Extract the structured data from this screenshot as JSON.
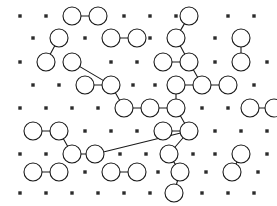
{
  "figure": {
    "width": 277,
    "height": 206,
    "background_color": "#ffffff",
    "stroke_color": "#1a1a1a",
    "square_fill_color": "#2b2b2b",
    "circle_fill_color": "#ffffff",
    "circle_radius": 9,
    "square_size": 3.4,
    "edge_width": 1.1,
    "circle_stroke_width": 1.1,
    "grid": {
      "columns": 10,
      "rows": 9,
      "x_spacing": 26,
      "y_spacing": 23,
      "x_origin": 20,
      "y_origin": 16,
      "row_offset": 13,
      "description": "alternating rows shifted by half a column"
    }
  },
  "chart_data": {
    "type": "scatter",
    "xlabel": "",
    "ylabel": "",
    "xlim": [
      0,
      277
    ],
    "ylim": [
      0,
      206
    ],
    "grid": false,
    "legend": null,
    "nodes": [
      {
        "id": "r0c0",
        "x": 20,
        "y": 16,
        "kind": "square"
      },
      {
        "id": "r0c1",
        "x": 46,
        "y": 16,
        "kind": "square"
      },
      {
        "id": "r0c2",
        "x": 72,
        "y": 16,
        "kind": "circle"
      },
      {
        "id": "r0c3",
        "x": 98,
        "y": 16,
        "kind": "circle"
      },
      {
        "id": "r0c4",
        "x": 124,
        "y": 16,
        "kind": "square"
      },
      {
        "id": "r0c5",
        "x": 150,
        "y": 16,
        "kind": "square"
      },
      {
        "id": "r0c6",
        "x": 176,
        "y": 16,
        "kind": "square"
      },
      {
        "id": "r0c7",
        "x": 189,
        "y": 16,
        "kind": "circle"
      },
      {
        "id": "r0c8",
        "x": 228,
        "y": 16,
        "kind": "square"
      },
      {
        "id": "r0c9",
        "x": 254,
        "y": 16,
        "kind": "square"
      },
      {
        "id": "r1c0",
        "x": 33,
        "y": 38,
        "kind": "square"
      },
      {
        "id": "r1c1",
        "x": 59,
        "y": 38,
        "kind": "circle"
      },
      {
        "id": "r1c2",
        "x": 85,
        "y": 38,
        "kind": "square"
      },
      {
        "id": "r1c3",
        "x": 111,
        "y": 38,
        "kind": "circle"
      },
      {
        "id": "r1c4",
        "x": 137,
        "y": 38,
        "kind": "circle"
      },
      {
        "id": "r1c5",
        "x": 150,
        "y": 38,
        "kind": "square"
      },
      {
        "id": "r1c6",
        "x": 176,
        "y": 38,
        "kind": "circle"
      },
      {
        "id": "r1c7",
        "x": 215,
        "y": 38,
        "kind": "square"
      },
      {
        "id": "r1c8",
        "x": 241,
        "y": 38,
        "kind": "circle"
      },
      {
        "id": "r2c0",
        "x": 20,
        "y": 62,
        "kind": "square"
      },
      {
        "id": "r2c1",
        "x": 46,
        "y": 62,
        "kind": "circle"
      },
      {
        "id": "r2c2",
        "x": 72,
        "y": 62,
        "kind": "circle"
      },
      {
        "id": "r2c3",
        "x": 111,
        "y": 62,
        "kind": "square"
      },
      {
        "id": "r2c4",
        "x": 137,
        "y": 62,
        "kind": "square"
      },
      {
        "id": "r2c5",
        "x": 163,
        "y": 62,
        "kind": "circle"
      },
      {
        "id": "r2c6",
        "x": 189,
        "y": 62,
        "kind": "circle"
      },
      {
        "id": "r2c7",
        "x": 215,
        "y": 62,
        "kind": "square"
      },
      {
        "id": "r2c8",
        "x": 241,
        "y": 62,
        "kind": "circle"
      },
      {
        "id": "r2c9",
        "x": 267,
        "y": 62,
        "kind": "square"
      },
      {
        "id": "r3c0",
        "x": 33,
        "y": 85,
        "kind": "square"
      },
      {
        "id": "r3c1",
        "x": 59,
        "y": 85,
        "kind": "square"
      },
      {
        "id": "r3c2",
        "x": 85,
        "y": 85,
        "kind": "circle"
      },
      {
        "id": "r3c3",
        "x": 111,
        "y": 85,
        "kind": "circle"
      },
      {
        "id": "r3c4",
        "x": 133,
        "y": 85,
        "kind": "square"
      },
      {
        "id": "r3c5",
        "x": 155,
        "y": 85,
        "kind": "square"
      },
      {
        "id": "r3c6",
        "x": 176,
        "y": 85,
        "kind": "circle"
      },
      {
        "id": "r3c7",
        "x": 202,
        "y": 85,
        "kind": "circle"
      },
      {
        "id": "r3c8",
        "x": 228,
        "y": 85,
        "kind": "circle"
      },
      {
        "id": "r3c9",
        "x": 254,
        "y": 85,
        "kind": "square"
      },
      {
        "id": "r4c0",
        "x": 20,
        "y": 108,
        "kind": "square"
      },
      {
        "id": "r4c1",
        "x": 46,
        "y": 108,
        "kind": "square"
      },
      {
        "id": "r4c2",
        "x": 72,
        "y": 108,
        "kind": "square"
      },
      {
        "id": "r4c3",
        "x": 98,
        "y": 108,
        "kind": "square"
      },
      {
        "id": "r4c4",
        "x": 124,
        "y": 108,
        "kind": "circle"
      },
      {
        "id": "r4c5",
        "x": 150,
        "y": 108,
        "kind": "circle"
      },
      {
        "id": "r4c6",
        "x": 176,
        "y": 108,
        "kind": "circle"
      },
      {
        "id": "r4c7",
        "x": 202,
        "y": 108,
        "kind": "square"
      },
      {
        "id": "r4c8",
        "x": 228,
        "y": 108,
        "kind": "square"
      },
      {
        "id": "r4c9",
        "x": 250,
        "y": 108,
        "kind": "circle"
      },
      {
        "id": "r4c10",
        "x": 274,
        "y": 108,
        "kind": "circle"
      },
      {
        "id": "r5c0",
        "x": 33,
        "y": 131,
        "kind": "circle"
      },
      {
        "id": "r5c1",
        "x": 59,
        "y": 131,
        "kind": "circle"
      },
      {
        "id": "r5c2",
        "x": 85,
        "y": 131,
        "kind": "square"
      },
      {
        "id": "r5c3",
        "x": 111,
        "y": 131,
        "kind": "square"
      },
      {
        "id": "r5c4",
        "x": 137,
        "y": 131,
        "kind": "square"
      },
      {
        "id": "r5c5",
        "x": 163,
        "y": 131,
        "kind": "circle"
      },
      {
        "id": "r5c6",
        "x": 189,
        "y": 131,
        "kind": "circle"
      },
      {
        "id": "r5c7",
        "x": 215,
        "y": 131,
        "kind": "square"
      },
      {
        "id": "r5c8",
        "x": 241,
        "y": 131,
        "kind": "square"
      },
      {
        "id": "r5c9",
        "x": 267,
        "y": 131,
        "kind": "square"
      },
      {
        "id": "r6c0",
        "x": 20,
        "y": 154,
        "kind": "square"
      },
      {
        "id": "r6c1",
        "x": 46,
        "y": 154,
        "kind": "square"
      },
      {
        "id": "r6c2",
        "x": 72,
        "y": 154,
        "kind": "circle"
      },
      {
        "id": "r6c3",
        "x": 95,
        "y": 154,
        "kind": "circle"
      },
      {
        "id": "r6c4",
        "x": 120,
        "y": 154,
        "kind": "square"
      },
      {
        "id": "r6c5",
        "x": 146,
        "y": 154,
        "kind": "square"
      },
      {
        "id": "r6c6",
        "x": 169,
        "y": 154,
        "kind": "circle"
      },
      {
        "id": "r6c7",
        "x": 193,
        "y": 154,
        "kind": "square"
      },
      {
        "id": "r6c8",
        "x": 215,
        "y": 154,
        "kind": "square"
      },
      {
        "id": "r6c9",
        "x": 241,
        "y": 154,
        "kind": "circle"
      },
      {
        "id": "r6c10",
        "x": 267,
        "y": 154,
        "kind": "square"
      },
      {
        "id": "r7c0",
        "x": 33,
        "y": 172,
        "kind": "circle"
      },
      {
        "id": "r7c1",
        "x": 59,
        "y": 172,
        "kind": "circle"
      },
      {
        "id": "r7c2",
        "x": 85,
        "y": 172,
        "kind": "square"
      },
      {
        "id": "r7c3",
        "x": 111,
        "y": 172,
        "kind": "circle"
      },
      {
        "id": "r7c4",
        "x": 137,
        "y": 172,
        "kind": "circle"
      },
      {
        "id": "r7c5",
        "x": 158,
        "y": 172,
        "kind": "square"
      },
      {
        "id": "r7c6",
        "x": 180,
        "y": 172,
        "kind": "circle"
      },
      {
        "id": "r7c7",
        "x": 206,
        "y": 172,
        "kind": "square"
      },
      {
        "id": "r7c8",
        "x": 232,
        "y": 172,
        "kind": "circle"
      },
      {
        "id": "r7c9",
        "x": 258,
        "y": 172,
        "kind": "square"
      },
      {
        "id": "r8c0",
        "x": 20,
        "y": 193,
        "kind": "square"
      },
      {
        "id": "r8c1",
        "x": 46,
        "y": 193,
        "kind": "square"
      },
      {
        "id": "r8c2",
        "x": 72,
        "y": 193,
        "kind": "square"
      },
      {
        "id": "r8c3",
        "x": 98,
        "y": 193,
        "kind": "square"
      },
      {
        "id": "r8c4",
        "x": 124,
        "y": 193,
        "kind": "square"
      },
      {
        "id": "r8c5",
        "x": 150,
        "y": 193,
        "kind": "square"
      },
      {
        "id": "r8c6",
        "x": 174,
        "y": 193,
        "kind": "circle"
      },
      {
        "id": "r8c7",
        "x": 202,
        "y": 193,
        "kind": "square"
      },
      {
        "id": "r8c8",
        "x": 228,
        "y": 193,
        "kind": "square"
      },
      {
        "id": "r8c9",
        "x": 254,
        "y": 193,
        "kind": "square"
      }
    ],
    "edges": [
      [
        "r0c2",
        "r0c3"
      ],
      [
        "r1c1",
        "r2c1"
      ],
      [
        "r1c3",
        "r1c4"
      ],
      [
        "r0c7",
        "r1c6"
      ],
      [
        "r2c8",
        "r1c8"
      ],
      [
        "r2c2",
        "r3c3"
      ],
      [
        "r3c2",
        "r3c3"
      ],
      [
        "r2c5",
        "r2c6"
      ],
      [
        "r1c6",
        "r2c6"
      ],
      [
        "r2c6",
        "r3c7"
      ],
      [
        "r3c6",
        "r3c7"
      ],
      [
        "r3c7",
        "r3c8"
      ],
      [
        "r3c3",
        "r4c4"
      ],
      [
        "r4c4",
        "r4c5"
      ],
      [
        "r3c6",
        "r4c6"
      ],
      [
        "r4c5",
        "r4c6"
      ],
      [
        "r4c9",
        "r4c10"
      ],
      [
        "r5c0",
        "r5c1"
      ],
      [
        "r5c1",
        "r6c2"
      ],
      [
        "r6c2",
        "r6c3"
      ],
      [
        "r6c3",
        "r5c6"
      ],
      [
        "r5c5",
        "r5c6"
      ],
      [
        "r4c6",
        "r5c6"
      ],
      [
        "r5c6",
        "r6c6"
      ],
      [
        "r6c6",
        "r7c6"
      ],
      [
        "r7c6",
        "r8c6"
      ],
      [
        "r7c0",
        "r7c1"
      ],
      [
        "r7c3",
        "r7c4"
      ],
      [
        "r6c9",
        "r7c8"
      ]
    ]
  }
}
